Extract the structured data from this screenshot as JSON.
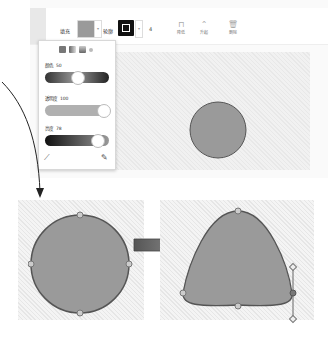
{
  "toolbar": {
    "fill_label": "填充",
    "outline_label": "轮廓",
    "fill_color": "#9a9a9a",
    "outline_color": "#111111",
    "dropdown_caret": "▾",
    "stroke_width": "4",
    "buttons": [
      {
        "label": "降低",
        "icon": "send-backward-icon",
        "glyph": "⊓"
      },
      {
        "label": "升起",
        "icon": "bring-forward-icon",
        "glyph": "⌃"
      },
      {
        "label": "删除",
        "icon": "trash-icon",
        "glyph": "🗑"
      }
    ]
  },
  "color_popup": {
    "modes": [
      "solid",
      "linear-gradient",
      "radial-gradient",
      "none"
    ],
    "hue_label": "颜色",
    "hue_value": "50",
    "opacity_label": "透明度",
    "opacity_value": "100",
    "brightness_label": "亮度",
    "brightness_value": "78",
    "left_icon": "pen-icon",
    "right_icon": "eyedropper-icon"
  },
  "canvas": {
    "shape": "circle",
    "shape_fill": "#9a9a9a",
    "shape_stroke": "#555555"
  },
  "illustration": {
    "before_shape": "circle-with-handles",
    "transform_arrow": "right-arrow",
    "after_shape": "reshaped-blob-with-bezier-handles"
  }
}
